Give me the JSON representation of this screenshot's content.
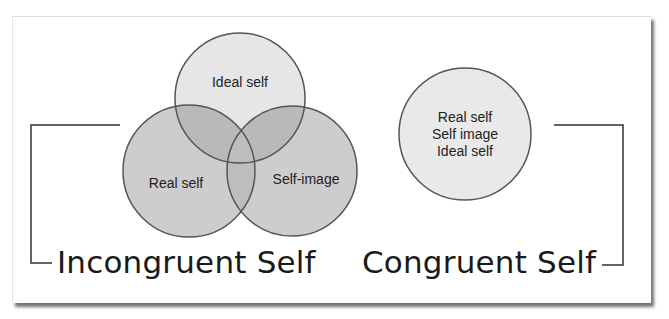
{
  "incongruent": {
    "title": "Incongruent Self",
    "circles": [
      {
        "label": "Ideal self",
        "cx": 240,
        "cy": 98,
        "r": 65,
        "fill": "#e6e6e6"
      },
      {
        "label": "Real self",
        "cx": 189,
        "cy": 171,
        "r": 66,
        "fill": "#c9c9c9"
      },
      {
        "label": "Self-image",
        "cx": 292,
        "cy": 171,
        "r": 65,
        "fill": "#c9c9c9"
      }
    ]
  },
  "congruent": {
    "title": "Congruent Self",
    "circle": {
      "lines": [
        "Real self",
        "Self image",
        "Ideal self"
      ],
      "cx": 465,
      "cy": 134,
      "r": 66,
      "fill": "#e9e9e9"
    }
  },
  "colors": {
    "stroke": "#555555",
    "bracket": "#333333",
    "text": "#1a1a1a"
  }
}
